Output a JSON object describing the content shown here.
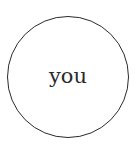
{
  "diagram": {
    "node": {
      "shape": "circle",
      "label": "you",
      "stroke_color": "#2a2a2a",
      "fill_color": "#ffffff"
    }
  }
}
